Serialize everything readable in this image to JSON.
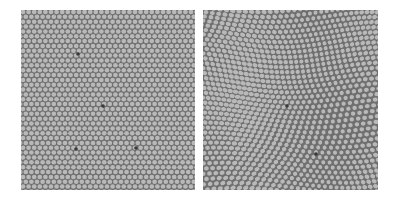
{
  "figure": {
    "panels": [
      {
        "id": "left",
        "description": "regular hexagonal cell lattice with point defects",
        "background_color": "#6f6f6f",
        "cell_color": "#b9b9b9",
        "defect_color": "#3a3a3a",
        "pitch_px": 5.6,
        "defects": [
          [
            57,
            44
          ],
          [
            82,
            96
          ],
          [
            55,
            139
          ],
          [
            115,
            138
          ]
        ]
      },
      {
        "id": "right",
        "description": "distorted (wavy) hexagonal cell lattice",
        "background_color": "#6f6f6f",
        "cell_color": "#b9b9b9",
        "defect_color": "#3a3a3a",
        "pitch_px": 5.8,
        "defects": [
          [
            84,
            96
          ],
          [
            113,
            144
          ]
        ]
      }
    ]
  }
}
